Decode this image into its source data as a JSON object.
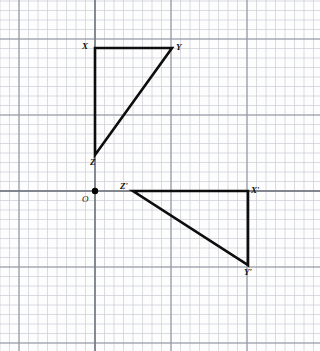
{
  "figure": {
    "width": 320,
    "height": 351,
    "background_color": "#fdfdfd",
    "grid": {
      "minor_spacing": 9.5,
      "major_spacing": 76,
      "minor_color": "#c8ccd4",
      "major_color": "#8d949e",
      "axis_color": "#6f757d",
      "minor_width": 0.7,
      "major_width": 1.1,
      "axis_width": 1.4,
      "origin_x": 95,
      "origin_y": 191,
      "x_major_lines": [
        19,
        95,
        171,
        247,
        323
      ],
      "y_major_lines": [
        39,
        115,
        191,
        267,
        343
      ]
    },
    "origin": {
      "label": "O",
      "dot_x": 95,
      "dot_y": 191,
      "dot_radius": 3.2,
      "dot_color": "#000000",
      "label_x": 82,
      "label_y": 195
    },
    "stroke_color": "#0d0d0d",
    "stroke_width": 2.6
  },
  "shapes": [
    {
      "name": "triangle-xyz",
      "points": "95,48 172,48 95,155",
      "vertices": [
        {
          "label": "X",
          "x": 95,
          "y": 48,
          "label_x": 82,
          "label_y": 42
        },
        {
          "label": "Y",
          "x": 172,
          "y": 48,
          "label_x": 176,
          "label_y": 43
        },
        {
          "label": "Z",
          "x": 95,
          "y": 155,
          "label_x": 90,
          "label_y": 158
        }
      ]
    },
    {
      "name": "triangle-x-prime-y-prime-z-prime",
      "points": "133,191 248,191 248,265",
      "vertices": [
        {
          "label": "Z'",
          "x": 133,
          "y": 191,
          "label_x": 120,
          "label_y": 182
        },
        {
          "label": "X'",
          "x": 248,
          "y": 191,
          "label_x": 251,
          "label_y": 186
        },
        {
          "label": "Y'",
          "x": 248,
          "y": 265,
          "label_x": 244,
          "label_y": 268
        }
      ]
    }
  ]
}
